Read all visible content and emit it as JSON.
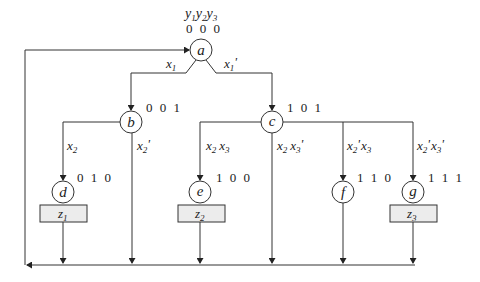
{
  "diagram": {
    "header": {
      "vars": [
        "y",
        "y",
        "y"
      ],
      "subs": [
        "1",
        "2",
        "3"
      ]
    },
    "nodes": {
      "a": {
        "label": "a",
        "code": "0 0 0"
      },
      "b": {
        "label": "b",
        "code": "0 0 1"
      },
      "c": {
        "label": "c",
        "code": "1 0 1"
      },
      "d": {
        "label": "d",
        "code": "0 1 0"
      },
      "e": {
        "label": "e",
        "code": "1 0 0"
      },
      "f": {
        "label": "f",
        "code": "1 1 0"
      },
      "g": {
        "label": "g",
        "code": "1 1 1"
      }
    },
    "outputs": {
      "z1": {
        "base": "z",
        "sub": "1"
      },
      "z2": {
        "base": "z",
        "sub": "2"
      },
      "z3": {
        "base": "z",
        "sub": "3"
      }
    },
    "conditions": {
      "a_to_b": {
        "v": "x",
        "s": "1",
        "p": ""
      },
      "a_to_c": {
        "v": "x",
        "s": "1",
        "p": "'"
      },
      "b_to_d": {
        "v": "x",
        "s": "2",
        "p": ""
      },
      "b_down": {
        "v": "x",
        "s": "2",
        "p": "'"
      },
      "c_to_e": {
        "v1": "x",
        "s1": "2",
        "p1": "",
        "v2": "x",
        "s2": "3",
        "p2": ""
      },
      "c_down": {
        "v1": "x",
        "s1": "2",
        "p1": "",
        "v2": "x",
        "s2": "3",
        "p2": "'"
      },
      "c_to_f": {
        "v1": "x",
        "s1": "2",
        "p1": "'",
        "v2": "x",
        "s2": "3",
        "p2": ""
      },
      "c_to_g": {
        "v1": "x",
        "s1": "2",
        "p1": "'",
        "v2": "x",
        "s2": "3",
        "p2": "'"
      }
    }
  }
}
